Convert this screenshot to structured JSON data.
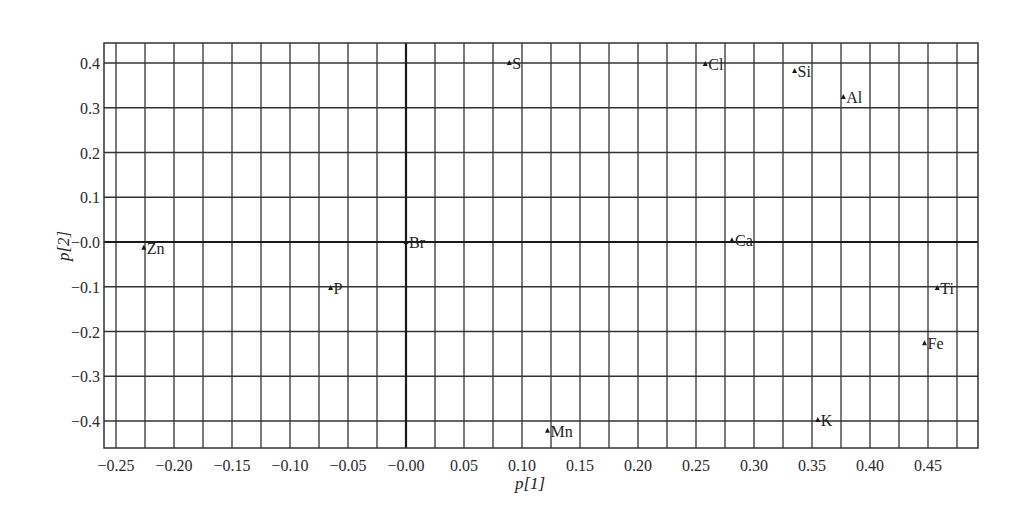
{
  "chart_data": {
    "type": "scatter",
    "title": "",
    "xlabel": "p[1]",
    "ylabel": "p[2]",
    "xlim": [
      -0.2625,
      0.4875
    ],
    "ylim": [
      -0.467,
      0.444
    ],
    "grid": true,
    "grid_x_step": 0.025,
    "grid_y_step": 0.1,
    "legend": null,
    "marker": "triangle",
    "x_ticks": [
      -0.25,
      -0.2,
      -0.15,
      -0.1,
      -0.05,
      0.0,
      0.05,
      0.1,
      0.15,
      0.2,
      0.25,
      0.3,
      0.35,
      0.4,
      0.45
    ],
    "x_tick_labels": [
      "-0.25",
      "-0.20",
      "-0.15",
      "-0.10",
      "-0.05",
      "-0.00",
      "0.05",
      "0.10",
      "0.15",
      "0.20",
      "0.25",
      "0.30",
      "0.35",
      "0.40",
      "0.45"
    ],
    "y_ticks": [
      0.4,
      0.3,
      0.2,
      0.1,
      0.0,
      -0.1,
      -0.2,
      -0.3,
      -0.4
    ],
    "y_tick_labels": [
      "0.4",
      "0.3",
      "0.2",
      "0.1",
      "-0.0",
      "-0.1",
      "-0.2",
      "-0.3",
      "-0.4"
    ],
    "points": [
      {
        "label": "Zn",
        "x": -0.226,
        "y": -0.013
      },
      {
        "label": "P",
        "x": -0.065,
        "y": -0.103
      },
      {
        "label": "Br",
        "x": 0.0,
        "y": 0.0
      },
      {
        "label": "S",
        "x": 0.089,
        "y": 0.4
      },
      {
        "label": "Cl",
        "x": 0.258,
        "y": 0.398
      },
      {
        "label": "Si",
        "x": 0.335,
        "y": 0.382
      },
      {
        "label": "Al",
        "x": 0.377,
        "y": 0.324
      },
      {
        "label": "Ca",
        "x": 0.281,
        "y": 0.004
      },
      {
        "label": "Ti",
        "x": 0.458,
        "y": -0.103
      },
      {
        "label": "Fe",
        "x": 0.447,
        "y": -0.226
      },
      {
        "label": "K",
        "x": 0.355,
        "y": -0.398
      },
      {
        "label": "Mn",
        "x": 0.122,
        "y": -0.422
      }
    ]
  },
  "style": {
    "line_color": "#333333",
    "axis_zero_color": "#1a1a1a",
    "marker_color": "#1a1a1a"
  }
}
